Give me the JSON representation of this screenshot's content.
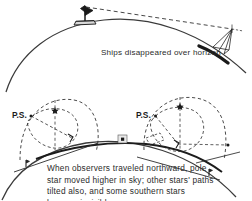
{
  "figure": {
    "background_color": "#ffffff",
    "line_color": "#262626",
    "text_color": "#2b2b2b",
    "width": 252,
    "height": 201
  },
  "panels": {
    "top": {
      "name": "ships-over-horizon",
      "caption": "Ships disappeared over horizon",
      "elements": {
        "earth_arc": "curved earth surface",
        "near_ship": "sailing ship near observer",
        "far_ship": "sailing ship hull hidden by horizon",
        "sight_lines": "lines of sight from observer to ship masts"
      }
    },
    "bottom": {
      "name": "pole-star-altitude",
      "caption": "When observers traveled northward, pole star moved higher in sky; other stars' paths tilted also, and some southern stars became invisible",
      "pole_star_label_left": "P.S.",
      "pole_star_label_right": "P.S.",
      "elements": {
        "earth_arc": "curved earth surface",
        "sky_dome_left": "celestial hemisphere at southern latitude",
        "sky_dome_right": "celestial hemisphere at northern latitude",
        "star_path_left": "tilted star path at southern latitude",
        "star_path_right": "tilted star path at northern latitude",
        "horizon_plane_left": "observer horizon plane, southern site",
        "horizon_plane_right": "observer horizon plane, northern site",
        "observer_left": "observer figure, southern site",
        "observer_right": "observer figure, northern site",
        "center_marker": "earth center marker"
      }
    }
  }
}
